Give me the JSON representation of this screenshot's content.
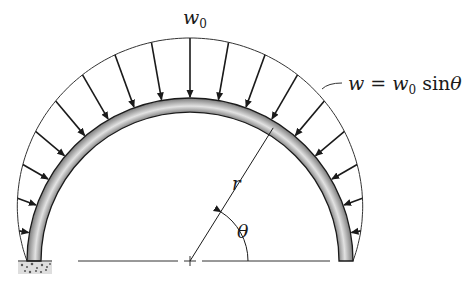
{
  "diagram": {
    "type": "semicircular arch with sinusoidal distributed load",
    "labels": {
      "peak_load": "w",
      "peak_load_sub": "0",
      "load_eq_w": "w",
      "load_eq_eq": " = ",
      "load_eq_w0": "w",
      "load_eq_sub": "0",
      "load_eq_sin": " sin",
      "load_eq_theta": "θ",
      "radius": "r",
      "angle": "θ"
    },
    "geometry": {
      "center": [
        190,
        261
      ],
      "outer_radius": 163,
      "inner_radius": 149,
      "peak_load_height": 60,
      "arrow_count": 17
    },
    "colors": {
      "ink": "#1a1a1a",
      "arch_light": "#d8d8d8",
      "arch_dark": "#7a7a7a",
      "ground": "#9a9a9a"
    }
  }
}
